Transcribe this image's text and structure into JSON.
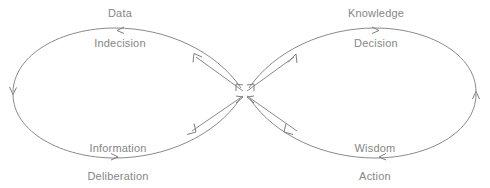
{
  "diagram": {
    "type": "figure-eight-cycle",
    "title": "",
    "stroke_color": "#8a8a8a",
    "text_color": "#868686",
    "background_color": "#ffffff",
    "left_loop": {
      "name": "indecision-deliberation-loop",
      "top_label": "Data",
      "top_sublabel": "Indecision",
      "bottom_label": "Information",
      "bottom_sublabel": "Deliberation"
    },
    "right_loop": {
      "name": "decision-action-loop",
      "top_label": "Knowledge",
      "top_sublabel": "Decision",
      "bottom_label": "Wisdom",
      "bottom_sublabel": "Action"
    },
    "labels": {
      "data": "Data",
      "indecision": "Indecision",
      "information": "Information",
      "deliberation": "Deliberation",
      "knowledge": "Knowledge",
      "decision": "Decision",
      "wisdom": "Wisdom",
      "action": "Action"
    }
  }
}
